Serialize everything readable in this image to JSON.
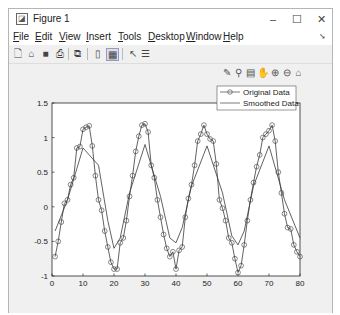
{
  "window": {
    "title": "Figure 1",
    "controls": {
      "minimize": "–",
      "maximize": "☐",
      "close": "✕"
    }
  },
  "menubar": {
    "items": [
      {
        "label": "File",
        "mnemonic": "F"
      },
      {
        "label": "Edit",
        "mnemonic": "E"
      },
      {
        "label": "View",
        "mnemonic": "V"
      },
      {
        "label": "Insert",
        "mnemonic": "I"
      },
      {
        "label": "Tools",
        "mnemonic": "T"
      },
      {
        "label": "Desktop",
        "mnemonic": "D"
      },
      {
        "label": "Window",
        "mnemonic": "W"
      },
      {
        "label": "Help",
        "mnemonic": "H"
      }
    ],
    "overflow_arrow": "➘"
  },
  "toolbar": {
    "icons": [
      "new-figure-icon",
      "open-file-icon",
      "save-icon",
      "print-icon",
      "print-preview-icon",
      "hide-plot-tools-icon",
      "show-plot-tools-icon",
      "edit-plot-arrow-icon",
      "insert-legend-icon"
    ]
  },
  "axes_toolbar": {
    "icons": [
      "brush-icon",
      "data-tips-icon",
      "export-icon",
      "pan-hand-icon",
      "zoom-in-icon",
      "zoom-out-icon",
      "home-icon"
    ]
  },
  "chart_data": {
    "type": "line",
    "title": "",
    "xlabel": "",
    "ylabel": "",
    "xlim": [
      0,
      80
    ],
    "ylim": [
      -1,
      1.5
    ],
    "xticks": [
      0,
      10,
      20,
      30,
      40,
      50,
      60,
      70,
      80
    ],
    "yticks": [
      -1,
      -0.5,
      0,
      0.5,
      1,
      1.5
    ],
    "ytick_labels": [
      "-1",
      "-0.5",
      "0",
      "0.5",
      "1",
      "1.5"
    ],
    "grid": false,
    "legend": {
      "position": "northeast",
      "entries": [
        "Original Data",
        "Smoothed Data"
      ]
    },
    "series": [
      {
        "name": "Original Data",
        "marker": "circle",
        "x": [
          1,
          2,
          3,
          4,
          5,
          6,
          7,
          8,
          9,
          10,
          11,
          12,
          13,
          14,
          15,
          16,
          17,
          18,
          19,
          20,
          21,
          22,
          23,
          24,
          25,
          26,
          27,
          28,
          29,
          30,
          31,
          32,
          33,
          34,
          35,
          36,
          37,
          38,
          39,
          40,
          41,
          42,
          43,
          44,
          45,
          46,
          47,
          48,
          49,
          50,
          51,
          52,
          53,
          54,
          55,
          56,
          57,
          58,
          59,
          60,
          61,
          62,
          63,
          64,
          65,
          66,
          67,
          68,
          69,
          70,
          71,
          72,
          73,
          74,
          75,
          76,
          77,
          78,
          79,
          80
        ],
        "y": [
          -0.72,
          -0.5,
          -0.22,
          0.05,
          0.1,
          0.32,
          0.42,
          0.85,
          0.87,
          1.12,
          1.15,
          1.17,
          0.88,
          0.45,
          0.1,
          -0.05,
          -0.35,
          -0.58,
          -0.8,
          -0.9,
          -0.9,
          -0.52,
          -0.45,
          -0.2,
          0.15,
          0.45,
          0.8,
          1.02,
          1.18,
          1.2,
          1.08,
          0.6,
          0.42,
          0.1,
          -0.15,
          -0.4,
          -0.6,
          -0.72,
          -0.65,
          -0.9,
          -0.63,
          -0.58,
          -0.15,
          0.12,
          0.32,
          0.6,
          0.95,
          1.05,
          1.18,
          1.05,
          0.98,
          0.95,
          0.62,
          0.1,
          -0.02,
          -0.2,
          -0.45,
          -0.52,
          -0.75,
          -0.95,
          -0.85,
          -0.55,
          -0.2,
          0.1,
          0.35,
          0.58,
          0.75,
          1.0,
          1.05,
          1.1,
          1.18,
          0.95,
          0.5,
          0.2,
          -0.1,
          -0.3,
          -0.32,
          -0.55,
          -0.65,
          -0.72
        ]
      },
      {
        "name": "Smoothed Data",
        "marker": "none",
        "x": [
          1,
          5,
          10,
          15,
          18,
          20,
          22,
          25,
          30,
          35,
          38,
          40,
          42,
          45,
          50,
          55,
          58,
          60,
          62,
          65,
          70,
          75,
          80
        ],
        "y": [
          -0.35,
          0.1,
          0.85,
          0.6,
          -0.2,
          -0.6,
          -0.45,
          0.2,
          0.9,
          0.15,
          -0.45,
          -0.52,
          -0.3,
          0.3,
          0.88,
          0.2,
          -0.42,
          -0.55,
          -0.35,
          0.3,
          0.88,
          0.1,
          -0.45
        ]
      }
    ]
  }
}
